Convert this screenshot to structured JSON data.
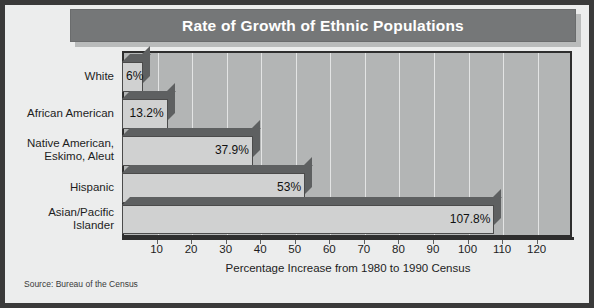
{
  "title": "Rate of Growth of Ethnic Populations",
  "source_note": "Source: Bureau of the Census",
  "xaxis_title": "Percentage Increase from 1980 to 1990 Census",
  "colors": {
    "frame": "#3a3a3a",
    "title_bar": "#757778",
    "title_text": "#ffffff",
    "plot_background": "#b3b5b5",
    "gridline": "#e3e4e4",
    "bar_face": "#d0d1d1",
    "bar_shade": "#5e6061",
    "page_background": "#eceded"
  },
  "chart_data": {
    "type": "bar",
    "orientation": "horizontal",
    "title": "Rate of Growth of Ethnic Populations",
    "xlabel": "Percentage Increase from 1980 to 1990 Census",
    "ylabel": "",
    "xlim": [
      0,
      125
    ],
    "grid": true,
    "legend": false,
    "categories": [
      "White",
      "African American",
      "Native American,\nEskimo, Aleut",
      "Hispanic",
      "Asian/Pacific\nIslander"
    ],
    "values": [
      6,
      13.2,
      37.9,
      53,
      107.8
    ],
    "data_labels": [
      "6%",
      "13.2%",
      "37.9%",
      "53%",
      "107.8%"
    ],
    "xticks": [
      10,
      20,
      30,
      40,
      50,
      60,
      70,
      80,
      90,
      100,
      110,
      120
    ],
    "xtick_labels": [
      "10",
      "20",
      "30",
      "40",
      "50",
      "60",
      "70",
      "80",
      "90",
      "100",
      "110",
      "120"
    ],
    "annotation": "Source: Bureau of the Census"
  },
  "category_labels": [
    {
      "lines": [
        "White"
      ]
    },
    {
      "lines": [
        "African American"
      ]
    },
    {
      "lines": [
        "Native American,",
        "Eskimo, Aleut"
      ]
    },
    {
      "lines": [
        "Hispanic"
      ]
    },
    {
      "lines": [
        "Asian/Pacific",
        "Islander"
      ]
    }
  ]
}
